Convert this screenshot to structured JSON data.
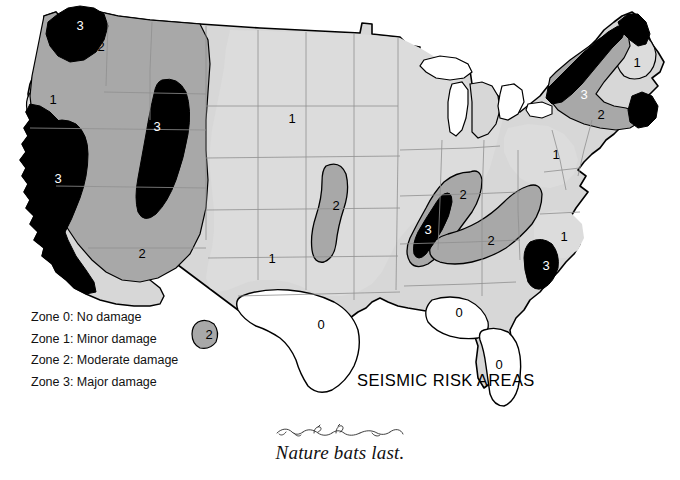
{
  "page": {
    "background_color": "#ffffff",
    "width": 680,
    "height": 480
  },
  "map": {
    "title": "SEISMIC RISK AREAS",
    "subject": "United States seismic risk zones",
    "outline_color": "#000000",
    "state_border_color": "#8c8c8c"
  },
  "legend": {
    "items": [
      {
        "label": "Zone 0: No damage",
        "zone": "0",
        "color": "#ffffff"
      },
      {
        "label": "Zone 1: Minor damage",
        "zone": "1",
        "color": "#d5d5d5"
      },
      {
        "label": "Zone 2: Moderate damage",
        "zone": "2",
        "color": "#a8a8a8"
      },
      {
        "label": "Zone 3: Major damage",
        "zone": "3",
        "color": "#000000"
      }
    ]
  },
  "zone_colors": {
    "zone0": "#ffffff",
    "zone1": "#d5d5d5",
    "zone2": "#a8a8a8",
    "zone3": "#000000",
    "zone1_light": "#dedede",
    "water": "#ffffff"
  },
  "zone_labels": [
    {
      "text": "3",
      "x": 80,
      "y": 27,
      "style": "light",
      "region": "puget-sound"
    },
    {
      "text": "2",
      "x": 101,
      "y": 48,
      "style": "dark",
      "region": "pacific-northwest"
    },
    {
      "text": "1",
      "x": 53,
      "y": 101,
      "style": "dark",
      "region": "idaho-snake-river"
    },
    {
      "text": "3",
      "x": 58,
      "y": 180,
      "style": "light",
      "region": "california-coast"
    },
    {
      "text": "3",
      "x": 157,
      "y": 128,
      "style": "light",
      "region": "nevada-utah-belt"
    },
    {
      "text": "2",
      "x": 142,
      "y": 255,
      "style": "dark",
      "region": "southwest"
    },
    {
      "text": "1",
      "x": 292,
      "y": 120,
      "style": "dark",
      "region": "northern-plains"
    },
    {
      "text": "2",
      "x": 336,
      "y": 207,
      "style": "dark",
      "region": "central-plains-band"
    },
    {
      "text": "1",
      "x": 272,
      "y": 260,
      "style": "dark",
      "region": "southern-plains"
    },
    {
      "text": "2",
      "x": 209,
      "y": 336,
      "style": "dark",
      "region": "west-texas-border"
    },
    {
      "text": "0",
      "x": 321,
      "y": 326,
      "style": "dark",
      "region": "texas"
    },
    {
      "text": "2",
      "x": 463,
      "y": 196,
      "style": "dark",
      "region": "new-madrid-outer"
    },
    {
      "text": "3",
      "x": 428,
      "y": 231,
      "style": "light",
      "region": "new-madrid-core"
    },
    {
      "text": "2",
      "x": 491,
      "y": 242,
      "style": "dark",
      "region": "southern-appalachian"
    },
    {
      "text": "0",
      "x": 459,
      "y": 314,
      "style": "dark",
      "region": "gulf-coast"
    },
    {
      "text": "0",
      "x": 499,
      "y": 366,
      "style": "dark",
      "region": "florida"
    },
    {
      "text": "3",
      "x": 546,
      "y": 267,
      "style": "light",
      "region": "charleston-sc"
    },
    {
      "text": "1",
      "x": 564,
      "y": 238,
      "style": "dark",
      "region": "carolinas"
    },
    {
      "text": "1",
      "x": 556,
      "y": 156,
      "style": "dark",
      "region": "ohio-valley"
    },
    {
      "text": "3",
      "x": 584,
      "y": 96,
      "style": "light",
      "region": "new-england-border"
    },
    {
      "text": "2",
      "x": 601,
      "y": 116,
      "style": "dark",
      "region": "new-england"
    },
    {
      "text": "3",
      "x": 645,
      "y": 112,
      "style": "dark",
      "region": "coastal-massachusetts"
    },
    {
      "text": "1",
      "x": 637,
      "y": 64,
      "style": "dark",
      "region": "maine"
    }
  ],
  "caption": {
    "text": "Nature bats last.",
    "ornament": "decorative-flourish"
  }
}
